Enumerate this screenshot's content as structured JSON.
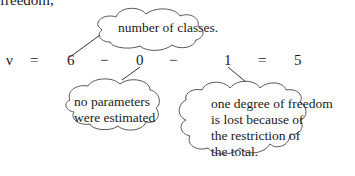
{
  "intro_text": "freedom,",
  "equation": {
    "lhs": "ν",
    "equals1": "=",
    "term1": "6",
    "minus1": "−",
    "term2": "0",
    "minus2": "−",
    "term3": "1",
    "equals2": "=",
    "result": "5"
  },
  "annotations": {
    "classes": "number of classes.",
    "parameters": [
      "no parameters",
      "were estimated"
    ],
    "restriction": [
      "one degree of freedom",
      "is lost because of",
      "the restriction of",
      "the total."
    ]
  }
}
